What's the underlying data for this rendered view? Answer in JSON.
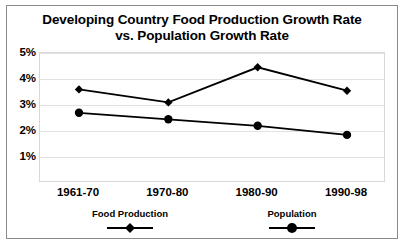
{
  "chart_data": {
    "type": "line",
    "title": "Developing Country Food Production Growth Rate vs. Population Growth Rate",
    "title_lines": [
      "Developing Country Food Production Growth Rate",
      "vs. Population Growth Rate"
    ],
    "xlabel": "",
    "ylabel": "",
    "categories": [
      "1961-70",
      "1970-80",
      "1980-90",
      "1990-98"
    ],
    "ylim": [
      0,
      5
    ],
    "ytick_labels": [
      "5%",
      "4%",
      "3%",
      "2%",
      "1%"
    ],
    "ytick_values": [
      5,
      4,
      3,
      2,
      1
    ],
    "grid": true,
    "legend_position": "bottom",
    "series": [
      {
        "name": "Food Production",
        "marker": "diamond",
        "color": "#000000",
        "values": [
          3.6,
          3.1,
          4.45,
          3.55
        ]
      },
      {
        "name": "Population",
        "marker": "circle",
        "color": "#000000",
        "values": [
          2.7,
          2.45,
          2.2,
          1.85
        ]
      }
    ]
  },
  "legend": {
    "entries": [
      {
        "label": "Food Production",
        "marker": "diamond-marker-icon"
      },
      {
        "label": "Population",
        "marker": "circle-marker-icon"
      }
    ]
  },
  "style": {
    "line_color": "#000000",
    "grid_color": "#e2e2e2",
    "frame_color": "#8a8a8a",
    "background": "#ffffff"
  }
}
